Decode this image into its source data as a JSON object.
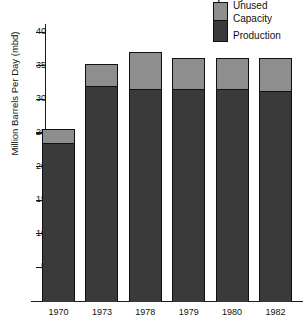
{
  "title_clipped": "World Crude Oil Production and Capacity",
  "chart_data": {
    "type": "bar",
    "stacked": true,
    "title": "",
    "xlabel": "",
    "ylabel": "Million Barrels Per Day (mbd)",
    "categories": [
      "1970",
      "1973",
      "1978",
      "1979",
      "1980",
      "1982"
    ],
    "ylim": [
      0,
      41.5
    ],
    "yticks": [
      5,
      10,
      15,
      20,
      25,
      30,
      35,
      40
    ],
    "ytick_labels": [
      "5",
      "10",
      "15",
      "20",
      "25",
      "30",
      "35",
      "40"
    ],
    "grid": false,
    "legend_position": "top-right",
    "series": [
      {
        "name": "Production",
        "color": "#3a3a3a",
        "values": [
          23.5,
          32.0,
          31.5,
          31.5,
          31.5,
          31.3
        ]
      },
      {
        "name": "Unused Capacity",
        "color": "#8e8e8e",
        "values": [
          2.1,
          3.3,
          5.6,
          4.7,
          4.7,
          4.9
        ]
      }
    ],
    "totals": [
      25.6,
      35.3,
      37.1,
      36.2,
      36.2,
      36.2
    ]
  },
  "legend": {
    "unused_line1": "Unused",
    "unused_line2": "Capacity",
    "production": "Production"
  },
  "axis": {
    "y_title": "Million Barrels Per Day (mbd)"
  }
}
